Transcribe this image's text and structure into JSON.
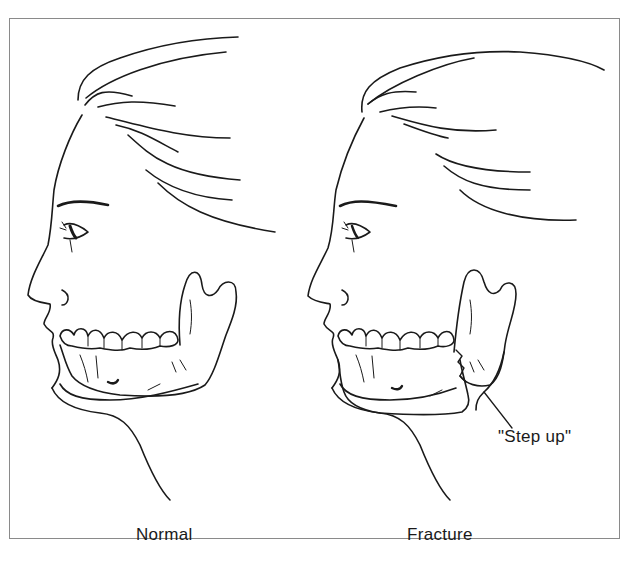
{
  "figure": {
    "panels": [
      {
        "id": "normal",
        "caption": "Normal"
      },
      {
        "id": "fracture",
        "caption": "Fracture"
      }
    ],
    "annotation": {
      "text": "\"Step up\"",
      "points_to": "mandible fracture step"
    },
    "colors": {
      "line": "#1a1a1a",
      "frame": "#8a8a8a",
      "background": "#ffffff"
    }
  }
}
